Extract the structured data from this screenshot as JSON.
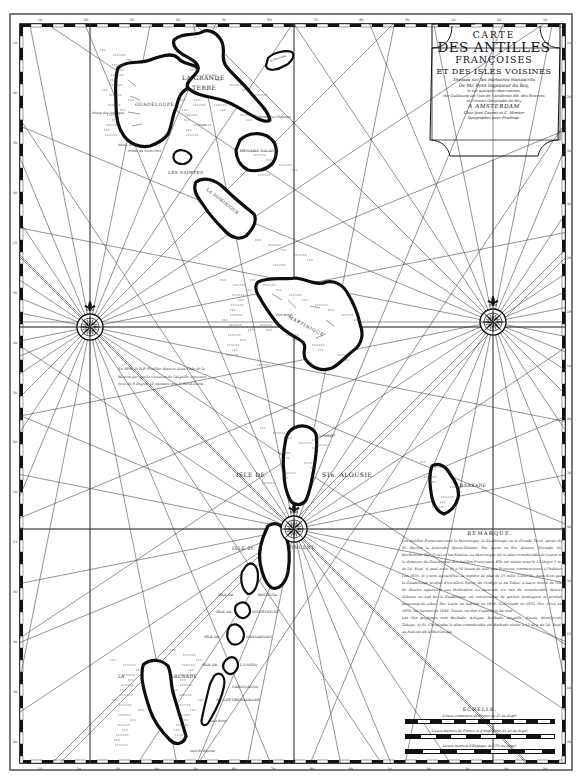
{
  "map": {
    "title": {
      "line1": "CARTE",
      "line2": "DES ANTILLES",
      "line3": "FRANÇOISES",
      "line4": "ET DES ISLES VOISINES",
      "line5": "Dressée sur les memoires manuscrits",
      "line6": "De Mr. Petit Ingenieur du Roy,",
      "line7": "et sur quelques observations.",
      "line8": "Par Guillaume De l'Isle de l'Academie Rle. des Sciences",
      "line9": "et Premier Geographe du Roy",
      "line10": "A AMSTERDAM",
      "line11": "Chez Jean Covens et C. Mortier",
      "line12": "Geographes avec Privilege."
    },
    "islands": [
      {
        "id": "guadeloupe",
        "label": "GUADELOUPE"
      },
      {
        "id": "grande-terre",
        "label_line1": "LA GRANDE",
        "label_line2": "TERRE"
      },
      {
        "id": "desirade",
        "label": "la Desirade"
      },
      {
        "id": "marie-galante",
        "label": "LA MARIE GALANTE"
      },
      {
        "id": "les-saintes",
        "label": "LES SAINTES"
      },
      {
        "id": "dominique",
        "label": "LA DOMINIQUE"
      },
      {
        "id": "martinique",
        "label": "MARTINIQUE"
      },
      {
        "id": "sainte-alousie",
        "label_line1": "ISLE DE",
        "label_line2": "STe. ALOUSIE"
      },
      {
        "id": "barbade",
        "label": "BARBADE"
      },
      {
        "id": "saint-vincent",
        "label_line1": "ISLE St.",
        "label_line2": "VINCENT"
      },
      {
        "id": "bequia",
        "label_line1": "ISLE DE",
        "label_line2": "BECOUYA"
      },
      {
        "id": "moustiques",
        "label_line1": "ISLE DE",
        "label_line2": "MOUSTIQUES"
      },
      {
        "id": "cannaouan",
        "label_line1": "ISLE DE",
        "label_line2": "CANNAOUAN"
      },
      {
        "id": "union",
        "label_line1": "ISLE DE",
        "label_line2": "L'UNION"
      },
      {
        "id": "cariouacou",
        "label_line1": "CARIOUACOU",
        "label_line2": "OU LES GRENADILLES"
      },
      {
        "id": "grenade",
        "label_line1": "LA",
        "label_line2": "GRENADE"
      }
    ],
    "small_labels": {
      "islet_ronde": "Islet Rond",
      "islet_bayona": "Islet de Bayona",
      "fort_royal": "Fort Royal",
      "pointe_chateaux": "Pointe des Chateaux",
      "basse_terre": "Basse Terre",
      "bourg": "Bourg des Habitans",
      "pointe_vieux_fort": "Pointe du Vieux Fort",
      "carenage": "Carenage"
    },
    "variation_note": "En 1698. le R.P. Feuillée observa dans l'Isle de la Martinique que la variation de l'Aiguille aimantée étoit de 6 degrés 12 minutes vers le Nord-Ouest.",
    "remarque": {
      "title": "REMARQUE.",
      "text": "Les Antilles Françoises sont la Martinique, la Guadeloupe ou la Grande Terre, partie de St. Martin, la Desirade, Marie-Galante, Ste. Lucie ou Ste. Alousie, Grenade, St. Barthelemi, Ste. Croix et les Saintes. La Martinique est la plus considerable de toutes et la demeure du Gouverneur des Antilles Françoises. Elle est située sous le 15 Degré 5 m. de lat. Sept. et peut avoir 45 à 50 lieues de tour. Les François commencerent à l'habiter l'an 1635. et y sont aujourd'hui au nombre de plus de 15 mille. Cette Ile, aussi bien que la Guadeloupe produit d'excellent Sucre, de l'Indigo et du Tabac. L'autre moitié de l'Ile St. Martin appartient aux Hollandois. La Desirade n'a rien de considerable. Marie-Galante au sud de la Guadeloupe est entrecoupée de petites montagnes et produit beaucoup de tabac. Ste. Lucie fut habitée en 1650. la Grenade en 1651. Ste. Croix en 1650. les Saintes en 1648. Toutes ces Iles s'appellent du Vent.",
      "text2": "Les Iles Angloises sont Barbade, Antigue, Barbude, Anguille, Nievis, Montferrat, Tabago, et St. Christophe la plus considerable est Barbade située à 13 deg. de lat. Sept. au Sud-est de la Martinique."
    },
    "echelle": {
      "title": "ECHELLE.",
      "scale1": "Lieues communes de France de 25 au degré.",
      "scale2": "Lieues marines de France et d'Angleterre de 20 au degré.",
      "scale3": "Lieues marines d'Espagne de 17½ au degré."
    },
    "graticule": {
      "top_ticks": [
        "10",
        "20",
        "30",
        "40",
        "50",
        "60",
        "70",
        "80",
        "90",
        "10",
        "20",
        "30"
      ],
      "bottom_ticks": [
        "10",
        "20",
        "30",
        "40",
        "50",
        "60",
        "70",
        "80",
        "90",
        "10",
        "20",
        "30",
        "40",
        "50"
      ],
      "left_ticks": [
        "10",
        "20",
        "30",
        "40",
        "15",
        "50",
        "40",
        "30",
        "20",
        "10",
        "14",
        "50",
        "40",
        "30",
        "20"
      ],
      "right_ticks": [
        "10",
        "20",
        "30",
        "40",
        "50",
        "16",
        "10",
        "20",
        "30",
        "40",
        "50",
        "15",
        "10",
        "20"
      ]
    },
    "colors": {
      "ink": "#111111",
      "paper": "#ffffff"
    }
  }
}
